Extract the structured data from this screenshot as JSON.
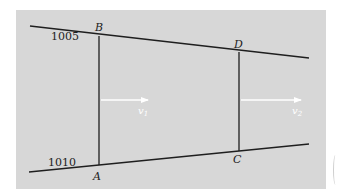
{
  "figure": {
    "background_color": "#d7d7d7",
    "line_color": "#1e1e1e",
    "arrow_color": "#ffffff",
    "boundaries": {
      "top": {
        "label": "1005",
        "from": [
          30,
          26
        ],
        "to": [
          309,
          58
        ]
      },
      "bottom": {
        "label": "1010",
        "from": [
          29,
          172
        ],
        "to": [
          309,
          144
        ]
      }
    },
    "sections": [
      {
        "name": "AB",
        "top_point": "B",
        "bottom_point": "A",
        "x": 99,
        "y_top": 36,
        "y_bottom": 165
      },
      {
        "name": "DC",
        "top_point": "D",
        "bottom_point": "C",
        "x": 239,
        "y_top": 52,
        "y_bottom": 151
      }
    ],
    "points": {
      "A": "A",
      "B": "B",
      "C": "C",
      "D": "D"
    },
    "velocities": [
      {
        "symbol": "v",
        "subscript": "1",
        "from_x": 101,
        "to_x": 148,
        "y": 100
      },
      {
        "symbol": "v",
        "subscript": "2",
        "from_x": 241,
        "to_x": 301,
        "y": 100
      }
    ]
  }
}
